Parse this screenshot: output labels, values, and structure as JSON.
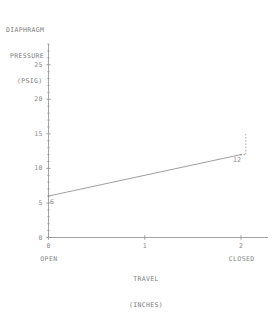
{
  "chart_data": {
    "type": "line",
    "title": "",
    "ylabel": "DIAPHRAGM PRESSURE (PSIG)",
    "ylabel_lines": [
      "DIAPHRAGM",
      "PRESSURE",
      "(PSIG)"
    ],
    "xlabel": "TRAVEL (INCHES)",
    "xlabel_lines": [
      "TRAVEL",
      "(INCHES)"
    ],
    "x": [
      0,
      2
    ],
    "values": [
      6,
      12
    ],
    "point_labels": [
      "6",
      "12"
    ],
    "xlim": [
      0,
      2.25
    ],
    "ylim": [
      0,
      28
    ],
    "xticks": [
      0,
      1,
      2
    ],
    "xtick_labels": [
      "0",
      "1",
      "2"
    ],
    "yticks": [
      0,
      5,
      10,
      15,
      20,
      25
    ],
    "ytick_labels": [
      "0",
      "5",
      "10",
      "15",
      "20",
      "25"
    ],
    "y_minor_tick_step": 1,
    "x_state_labels": [
      {
        "at": 0,
        "label": "OPEN"
      },
      {
        "at": 2,
        "label": "CLOSED"
      }
    ],
    "grid": false,
    "legend": "none",
    "annotations": [
      {
        "name": "closed-limit-dashed",
        "x": 2.05,
        "y_from": 12,
        "y_to": 15,
        "style": "dashed"
      }
    ],
    "line_color": "#8c8c8c",
    "axis_color": "#9a9a9a",
    "text_color": "#8b8b8b"
  },
  "caption": ""
}
